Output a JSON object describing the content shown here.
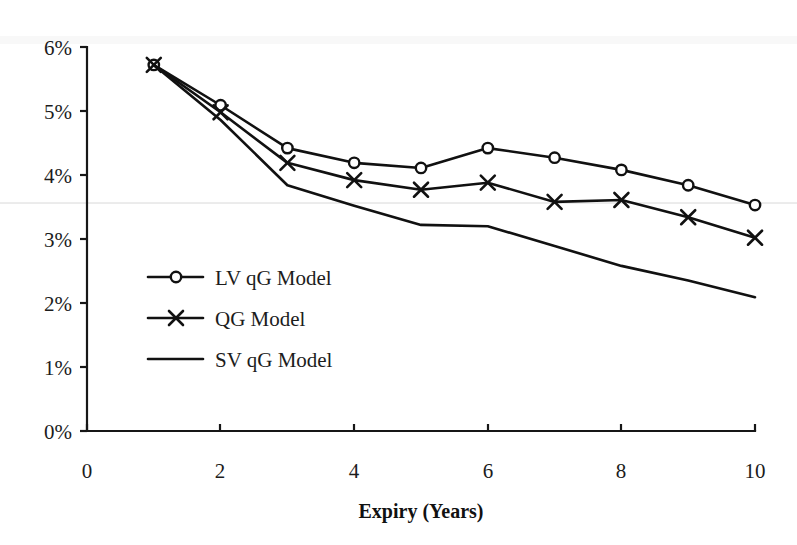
{
  "chart_data": {
    "type": "line",
    "title": "",
    "xlabel": "Expiry (Years)",
    "ylabel": "",
    "xlim": [
      0,
      10
    ],
    "ylim": [
      0,
      0.06
    ],
    "grid": false,
    "legend_position": "inside-left",
    "x": [
      1,
      2,
      3,
      4,
      5,
      6,
      7,
      8,
      9,
      10
    ],
    "xticks": [
      0,
      2,
      4,
      6,
      8,
      10
    ],
    "xtick_labels": [
      "0",
      "2",
      "4",
      "6",
      "8",
      "10"
    ],
    "yticks": [
      0,
      0.01,
      0.02,
      0.03,
      0.04,
      0.05,
      0.06
    ],
    "ytick_labels": [
      "0%",
      "1%",
      "2%",
      "3%",
      "4%",
      "5%",
      "6%"
    ],
    "series": [
      {
        "name": "LV qG Model",
        "marker": "circle",
        "values": [
          5.72,
          5.09,
          4.42,
          4.19,
          4.11,
          4.42,
          4.27,
          4.08,
          3.84,
          3.53
        ]
      },
      {
        "name": "QG Model",
        "marker": "x",
        "values": [
          5.72,
          4.98,
          4.19,
          3.92,
          3.77,
          3.88,
          3.58,
          3.61,
          3.34,
          3.02
        ]
      },
      {
        "name": "SV qG Model",
        "marker": "none",
        "values": [
          5.72,
          4.86,
          3.84,
          3.52,
          3.22,
          3.2,
          2.89,
          2.58,
          2.35,
          2.09
        ]
      }
    ]
  },
  "axes": {
    "x_axis_label": "Expiry (Years)",
    "x_tick_labels": [
      "0",
      "2",
      "4",
      "6",
      "8",
      "10"
    ],
    "y_tick_labels": [
      "0%",
      "1%",
      "2%",
      "3%",
      "4%",
      "5%",
      "6%"
    ]
  },
  "legend": {
    "items": [
      {
        "label": "LV qG Model",
        "marker": "circle-marker"
      },
      {
        "label": "QG Model",
        "marker": "x-marker"
      },
      {
        "label": "SV qG Model",
        "marker": "plain-line-marker"
      }
    ]
  }
}
